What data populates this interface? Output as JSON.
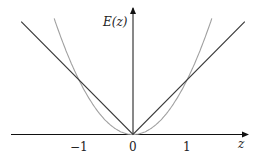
{
  "chart_data": {
    "type": "line",
    "title": "",
    "xlabel": "z",
    "ylabel": "E(z)",
    "xlim": [
      -2.07,
      2.07
    ],
    "ylim": [
      0,
      2.1
    ],
    "grid": false,
    "legend": null,
    "x_ticks": [
      -1,
      0,
      1
    ],
    "x_tick_labels": [
      "−1",
      "0",
      "1"
    ],
    "series": [
      {
        "name": "|z|",
        "color": "#3a3a3a",
        "x": [
          -2.07,
          0,
          2.07
        ],
        "y": [
          2.07,
          0,
          2.07
        ]
      },
      {
        "name": "z^2",
        "color": "#a0a0a0",
        "x": [
          -1.46,
          -1.2,
          -1.0,
          -0.8,
          -0.6,
          -0.4,
          -0.2,
          0,
          0.2,
          0.4,
          0.6,
          0.8,
          1.0,
          1.2,
          1.46
        ],
        "y": [
          2.13,
          1.44,
          1.0,
          0.64,
          0.36,
          0.16,
          0.04,
          0,
          0.04,
          0.16,
          0.36,
          0.64,
          1.0,
          1.44,
          2.13
        ]
      }
    ],
    "annotations": [
      "Curves intersect at z = -1 and z = 1"
    ]
  },
  "labels": {
    "y_axis": "E(z)",
    "x_axis": "z",
    "tick_neg1": "−1",
    "tick_0": "0",
    "tick_1": "1"
  }
}
